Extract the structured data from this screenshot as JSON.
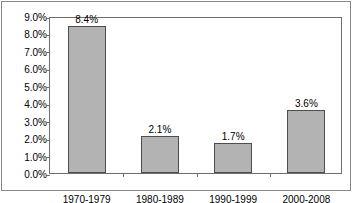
{
  "chart_data": {
    "type": "bar",
    "title": "",
    "subtitle": "",
    "xlabel": "",
    "ylabel": "",
    "categories": [
      "1970-1979",
      "1980-1989",
      "1990-1999",
      "2000-2008"
    ],
    "values": [
      8.4,
      2.1,
      1.7,
      3.6
    ],
    "value_labels": [
      "8.4%",
      "2.1%",
      "1.7%",
      "3.6%"
    ],
    "ylim": [
      0,
      9
    ],
    "ytick_values": [
      9.0,
      8.0,
      7.0,
      6.0,
      5.0,
      4.0,
      3.0,
      2.0,
      1.0,
      0.0
    ],
    "ytick_labels": [
      "9.0%",
      "8.0%",
      "7.0%",
      "6.0%",
      "5.0%",
      "4.0%",
      "3.0%",
      "2.0%",
      "1.0%",
      "0.0%"
    ],
    "grid": false,
    "legend": null,
    "series": [
      {
        "name": "",
        "values": [
          8.4,
          2.1,
          1.7,
          3.6
        ]
      }
    ],
    "colors": {
      "bar_fill": "#b3b3b3",
      "bar_border": "#4d4d4d",
      "axis": "#6e6e6e",
      "frame": "#888888",
      "text": "#000000",
      "background": "#ffffff"
    }
  }
}
